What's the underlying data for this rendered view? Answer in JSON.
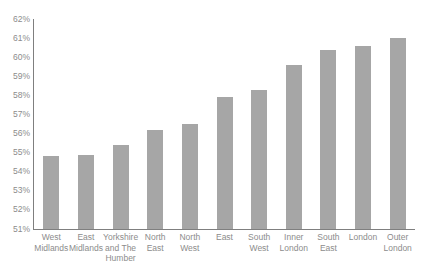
{
  "chart_data": {
    "type": "bar",
    "title": "",
    "subtitle": "",
    "xlabel": "",
    "ylabel": "",
    "ylim": [
      51,
      62
    ],
    "ytick_step": 1,
    "grid": false,
    "legend": "none",
    "bar_color": "#a6a6a6",
    "axis_color": "#7f7f7f",
    "label_color": "#8c8c8c",
    "ytick_labels": [
      "62%",
      "61%",
      "60%",
      "59%",
      "58%",
      "57%",
      "56%",
      "55%",
      "54%",
      "53%",
      "52%",
      "51%"
    ],
    "ytick_values": [
      62,
      61,
      60,
      59,
      58,
      57,
      56,
      55,
      54,
      53,
      52,
      51
    ],
    "categories": [
      "West Midlands",
      "East Midlands",
      "Yorkshire and The Humber",
      "North East",
      "North West",
      "East",
      "South West",
      "Inner London",
      "South East",
      "London",
      "Outer London"
    ],
    "category_lines": [
      [
        "West",
        "Midlands"
      ],
      [
        "East",
        "Midlands"
      ],
      [
        "Yorkshire",
        "and The",
        "Humber"
      ],
      [
        "North",
        "East"
      ],
      [
        "North",
        "West"
      ],
      [
        "East"
      ],
      [
        "South",
        "West"
      ],
      [
        "Inner",
        "London"
      ],
      [
        "South",
        "East"
      ],
      [
        "London"
      ],
      [
        "Outer",
        "London"
      ]
    ],
    "values": [
      54.8,
      54.9,
      55.4,
      56.2,
      56.5,
      57.9,
      58.3,
      59.6,
      60.4,
      60.6,
      61.0
    ]
  }
}
